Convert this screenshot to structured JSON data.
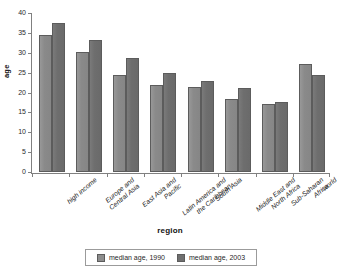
{
  "figure": {
    "title_remnant": "",
    "background_color": "#ffffff"
  },
  "chart_data": {
    "type": "bar",
    "title": "",
    "xlabel": "region",
    "ylabel": "age",
    "ylim": [
      0,
      40
    ],
    "yticks": [
      0,
      5,
      10,
      15,
      20,
      25,
      30,
      35,
      40
    ],
    "grid": false,
    "legend_position": "bottom",
    "categories": [
      "high income",
      "Europe and Central Asia",
      "East Asia and Pacific",
      "Latin America and the Caribbean",
      "South Asia",
      "Middle East and North Africa",
      "Sub-Saharan Africa",
      "world"
    ],
    "category_lines": [
      [
        "high income"
      ],
      [
        "Europe and",
        "Central Asia"
      ],
      [
        "East Asia and",
        "Pacific"
      ],
      [
        "Latin America and",
        "the Caribbean"
      ],
      [
        "South Asia"
      ],
      [
        "Middle East and",
        "North Africa"
      ],
      [
        "Sub-Saharan",
        "Africa"
      ],
      [
        "world"
      ]
    ],
    "series": [
      {
        "name": "median age, 1990",
        "color": "#8d8d8d",
        "values": [
          34.5,
          30.3,
          24.3,
          22.0,
          21.3,
          18.4,
          17.2,
          27.2
        ]
      },
      {
        "name": "median age, 2003",
        "color": "#6f6f6f",
        "values": [
          37.5,
          33.1,
          28.7,
          24.9,
          22.9,
          21.2,
          17.7,
          24.5
        ]
      }
    ]
  }
}
